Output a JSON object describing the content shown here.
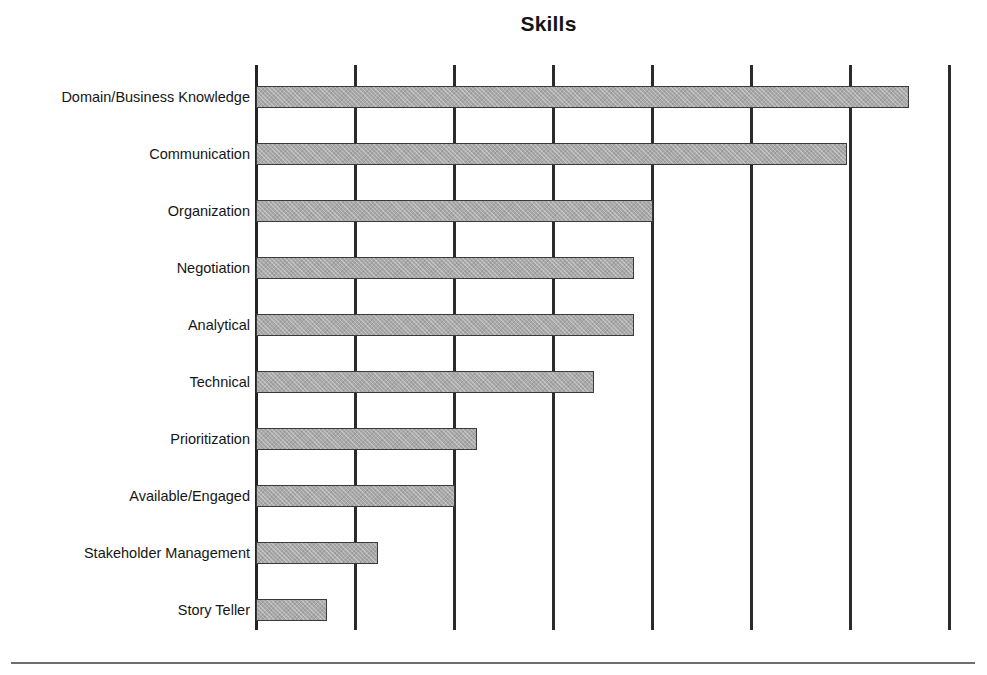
{
  "chart_data": {
    "type": "bar",
    "orientation": "horizontal",
    "title": "Skills",
    "xlabel": "",
    "ylabel": "",
    "categories": [
      "Domain/Business Knowledge",
      "Communication",
      "Organization",
      "Negotiation",
      "Analytical",
      "Technical",
      "Prioritization",
      "Available/Engaged",
      "Stakeholder Management",
      "Story Teller"
    ],
    "values": [
      6.6,
      5.97,
      4.01,
      3.82,
      3.82,
      3.41,
      2.23,
      2.01,
      1.23,
      0.72
    ],
    "xlim": [
      0,
      7
    ],
    "gridlines_x": [
      0,
      1,
      2,
      3,
      4,
      5,
      6,
      7
    ],
    "x_tick_labels": [],
    "y_tick_labels": [
      "Domain/Business Knowledge",
      "Communication",
      "Organization",
      "Negotiation",
      "Analytical",
      "Technical",
      "Prioritization",
      "Available/Engaged",
      "Stakeholder Management",
      "Story Teller"
    ],
    "legend": [],
    "legend_position": "none",
    "grid": true,
    "bar_fill_color": "#a9a9a9",
    "bar_border_color": "#3a3a3a",
    "gridline_color": "#2b2b2b",
    "title_color": "#141414",
    "background_color": "#ffffff"
  },
  "figure": {
    "footer_rule_color": "#6e6e6e"
  }
}
